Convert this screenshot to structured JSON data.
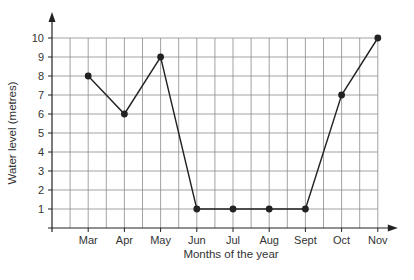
{
  "chart_data": {
    "type": "line",
    "title": "",
    "xlabel": "Months of the year",
    "ylabel": "Water level (metres)",
    "categories": [
      "Mar",
      "Apr",
      "May",
      "Jun",
      "Jul",
      "Aug",
      "Sept",
      "Oct",
      "Nov"
    ],
    "series": [
      {
        "name": "Water level",
        "values": [
          8,
          6,
          9,
          1,
          1,
          1,
          1,
          7,
          10
        ]
      }
    ],
    "y_ticks": [
      1,
      2,
      3,
      4,
      5,
      6,
      7,
      8,
      9,
      10
    ],
    "ylim": [
      0,
      10
    ],
    "grid": true,
    "legend": "none",
    "colors": {
      "line": "#222222",
      "grid": "#8a8a8a",
      "axis": "#222222",
      "text": "#333333"
    }
  }
}
